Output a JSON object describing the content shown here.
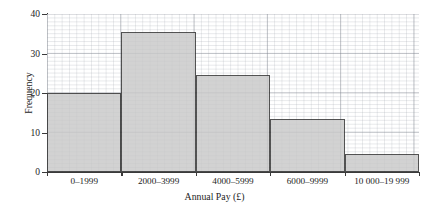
{
  "chart_data": {
    "type": "bar",
    "title": "",
    "xlabel": "Annual Pay (£)",
    "ylabel": "Frequency",
    "categories": [
      "0–1999",
      "2000–3999",
      "4000–5999",
      "6000–9999",
      "10 000–19 999"
    ],
    "values": [
      20,
      35.5,
      24.5,
      13.5,
      4.5
    ],
    "ylim": [
      0,
      40
    ],
    "yticks": [
      0,
      10,
      20,
      30,
      40
    ],
    "ytick_labels": [
      "0",
      "10",
      "20",
      "30",
      "40"
    ],
    "grid": true,
    "grid_style": "graph-paper, minor 1 unit, major 5 units",
    "legend": false,
    "bar_fill_color": "#c9c9c9",
    "bar_edge_color": "#2e2e2e",
    "background_color": "#ffffff",
    "grid_color": "#787d87",
    "axis_color": "#3a3a3a"
  },
  "axes": {
    "y_title": "Frequency",
    "x_title": "Annual Pay (£)"
  }
}
